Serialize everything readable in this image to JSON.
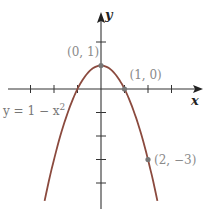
{
  "chart_data": {
    "type": "line",
    "title": "",
    "xlabel": "x",
    "ylabel": "y",
    "xlim": [
      -4,
      4
    ],
    "ylim": [
      -4.5,
      3.2
    ],
    "x_ticks": [
      -3,
      -2,
      -1,
      1,
      2,
      3
    ],
    "y_ticks": [
      -4,
      -3,
      -2,
      -1,
      2
    ],
    "grid": false,
    "series": [
      {
        "name": "y = 1 − x²",
        "expression": "1 - x^2",
        "x_range": [
          -2.4,
          2.4
        ],
        "color": "#8b4a3e"
      }
    ],
    "points": [
      {
        "x": 0,
        "y": 1,
        "label": "(0, 1)"
      },
      {
        "x": 1,
        "y": 0,
        "label": "(1, 0)"
      },
      {
        "x": 2,
        "y": -3,
        "label": "(2, −3)"
      }
    ],
    "equation_label": {
      "prefix": "y = 1 − x",
      "superscript": "2"
    }
  }
}
